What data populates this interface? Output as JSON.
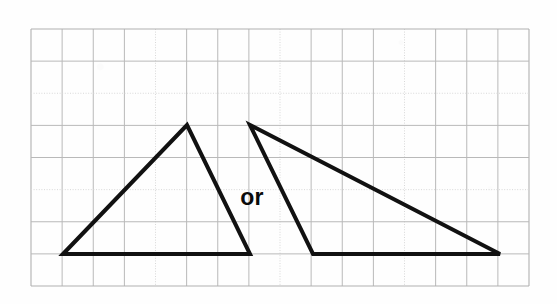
{
  "page": {
    "background_color": "#fefefe",
    "width": 557,
    "height": 304
  },
  "grid": {
    "name": "graph-paper-grid",
    "left": 31,
    "top": 29,
    "right": 529,
    "bottom": 286,
    "columns": 16,
    "rows": 8,
    "cell_width": 31.1,
    "cell_height": 32.1,
    "line_color": "#b9b9b9",
    "faint_line_color": "#d8d8d8",
    "border_color": "#b0b0b0",
    "faint_row_indices": [
      2,
      5
    ],
    "faint_column_indices": [
      4,
      8,
      12
    ]
  },
  "figure": {
    "stroke_color": "#111111",
    "stroke_width": 4,
    "shapes": [
      {
        "name": "left-triangle",
        "label": "acute triangle",
        "points": "63,254 187,125 250,254",
        "vertices": [
          {
            "x": 63,
            "y": 254
          },
          {
            "x": 187,
            "y": 125
          },
          {
            "x": 250,
            "y": 254
          }
        ],
        "base_cells": 6,
        "height_cells": 4
      },
      {
        "name": "right-triangle",
        "label": "obtuse triangle",
        "points": "250,125 313,254 500,254",
        "vertices": [
          {
            "x": 250,
            "y": 125
          },
          {
            "x": 313,
            "y": 254
          },
          {
            "x": 500,
            "y": 254
          }
        ],
        "base_cells": 6,
        "height_cells": 4
      }
    ],
    "or_label": {
      "text": "or",
      "x": 252,
      "y": 205,
      "color": "#0b0b0b"
    }
  }
}
